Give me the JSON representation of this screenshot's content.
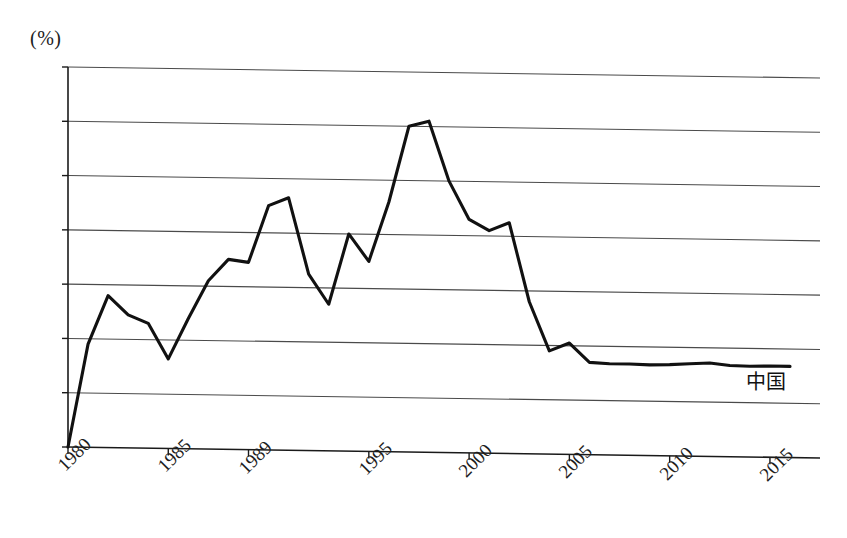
{
  "chart_data": {
    "type": "line",
    "title": "",
    "subtitle": "",
    "xlabel": "",
    "ylabel": "(%)",
    "unit_label": "(%)",
    "xlim": [
      1980,
      2016
    ],
    "ylim": [
      10,
      17
    ],
    "grid": true,
    "legend_position": "inline-right",
    "y_ticks": [
      17,
      16,
      15,
      14,
      13,
      12,
      11,
      10
    ],
    "y_tick_labels": [
      "17",
      "16",
      "15",
      "14",
      "13",
      "12",
      "11",
      "10"
    ],
    "x_ticks": [
      1980,
      1985,
      1989,
      1995,
      2000,
      2005,
      2010,
      2015
    ],
    "x_tick_labels": [
      "1980",
      "1985",
      "1989",
      "1995",
      "2000",
      "2005",
      "2010",
      "2015"
    ],
    "series": [
      {
        "name": "中国",
        "color": "#111111",
        "x": [
          1980,
          1981,
          1982,
          1983,
          1984,
          1985,
          1986,
          1987,
          1988,
          1989,
          1990,
          1991,
          1992,
          1993,
          1994,
          1995,
          1996,
          1997,
          1998,
          1999,
          2000,
          2001,
          2002,
          2003,
          2004,
          2005,
          2006,
          2007,
          2008,
          2009,
          2010,
          2011,
          2012,
          2013,
          2014,
          2015,
          2016
        ],
        "values": [
          10.0,
          11.9,
          12.8,
          12.45,
          12.3,
          11.65,
          12.4,
          13.1,
          13.5,
          13.45,
          14.5,
          14.65,
          13.25,
          12.7,
          14.0,
          13.5,
          14.6,
          16.0,
          16.1,
          15.0,
          14.3,
          14.1,
          14.25,
          12.8,
          11.9,
          12.05,
          11.7,
          11.68,
          11.68,
          11.67,
          11.68,
          11.7,
          11.72,
          11.68,
          11.67,
          11.68,
          11.68
        ]
      }
    ],
    "annotations": [
      {
        "name": "series-label-china",
        "text": "中国",
        "x": 2014,
        "y": 11.2
      }
    ]
  },
  "legend": {
    "china_label": "中国"
  }
}
